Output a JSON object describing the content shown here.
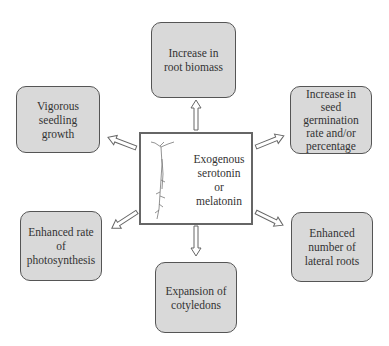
{
  "center": {
    "label_lines": [
      "Exogenous",
      "serotonin",
      "or",
      "melatonin"
    ],
    "image": "seedling-illustration"
  },
  "effects": [
    {
      "id": "top",
      "label": "Increase in root biomass"
    },
    {
      "id": "upper-left",
      "label": "Vigorous seedling growth"
    },
    {
      "id": "upper-right",
      "label": "Increase in seed germination rate and/or percentage"
    },
    {
      "id": "lower-left",
      "label": "Enhanced rate of photosynthesis"
    },
    {
      "id": "lower-right",
      "label": "Enhanced number of lateral roots"
    },
    {
      "id": "bottom",
      "label": "Expansion of cotyledons"
    }
  ],
  "colors": {
    "box_fill": "#d9d9d9",
    "box_border": "#555555",
    "arrow": "#666666"
  }
}
